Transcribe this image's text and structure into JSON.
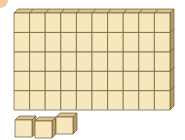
{
  "diagram": {
    "tens_rods": 5,
    "cubes_per_rod": 10,
    "ones_cubes": 3,
    "represented_value": 53
  },
  "colors": {
    "face": "#f6e7bd",
    "top": "#d9c08e",
    "side": "#b89a63",
    "edge": "#6e5a3a",
    "background": "#ffffff"
  }
}
